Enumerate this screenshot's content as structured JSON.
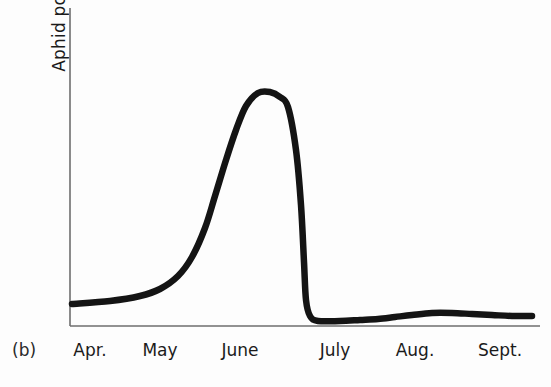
{
  "figure": {
    "panel_label": "(b)",
    "ylabel": "Aphid pop.",
    "line_color": "#141414",
    "axis_color": "#6e6e6e"
  },
  "chart_data": {
    "type": "line",
    "title": "",
    "xlabel": "",
    "ylabel": "Aphid pop.",
    "categories": [
      "Apr.",
      "May",
      "June",
      "July",
      "Aug.",
      "Sept."
    ],
    "tick_x_px": [
      90,
      160,
      240,
      335,
      415,
      500
    ],
    "grid": false,
    "legend": null,
    "axis_ranges": {
      "x_px": [
        70,
        540
      ],
      "y_px": [
        8,
        326
      ]
    },
    "series": [
      {
        "name": "Aphid population",
        "comment": "Relative population index read off the curve; no numeric y-axis ticks are printed on the figure.",
        "x": [
          "Apr.",
          "Apr. mid",
          "May",
          "May mid",
          "early June",
          "mid June",
          "June peak",
          "late June",
          "end June",
          "July",
          "July mid",
          "Aug.",
          "Aug. mid",
          "Sept.",
          "late Sept."
        ],
        "values": [
          7,
          8,
          11,
          18,
          42,
          78,
          100,
          98,
          88,
          4,
          2,
          3,
          5,
          5,
          4
        ],
        "points_px": [
          [
            72,
            304
          ],
          [
            110,
            301
          ],
          [
            140,
            296
          ],
          [
            160,
            289
          ],
          [
            178,
            276
          ],
          [
            192,
            257
          ],
          [
            205,
            228
          ],
          [
            215,
            196
          ],
          [
            226,
            160
          ],
          [
            236,
            130
          ],
          [
            246,
            106
          ],
          [
            258,
            93
          ],
          [
            270,
            92
          ],
          [
            280,
            97
          ],
          [
            288,
            107
          ],
          [
            296,
            150
          ],
          [
            301,
            205
          ],
          [
            304,
            262
          ],
          [
            306,
            300
          ],
          [
            310,
            316
          ],
          [
            318,
            321
          ],
          [
            340,
            321
          ],
          [
            360,
            320
          ],
          [
            378,
            319
          ],
          [
            395,
            317
          ],
          [
            412,
            315
          ],
          [
            432,
            313
          ],
          [
            452,
            313
          ],
          [
            472,
            314
          ],
          [
            492,
            315
          ],
          [
            512,
            316
          ],
          [
            532,
            316
          ]
        ]
      }
    ],
    "annotations": [
      {
        "text": "(b)",
        "role": "panel-letter"
      }
    ]
  }
}
